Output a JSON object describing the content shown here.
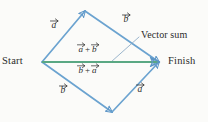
{
  "figure": {
    "kind": "vector-addition-parallelogram-diagram",
    "background_color": "#fbfbf9"
  },
  "colors": {
    "vector_blue": "#6ba3d0",
    "vector_blue_dark": "#4b86bb",
    "resultant_green": "#5aa883",
    "leader_line": "#8aa9c4",
    "text": "#2b2b2b"
  },
  "endpoints": {
    "start_label": "Start",
    "finish_label": "Finish"
  },
  "annotation": {
    "vector_sum_label": "Vector sum"
  },
  "edge_labels": {
    "top_left": {
      "letter": "a"
    },
    "top_right": {
      "letter": "b"
    },
    "bottom_left": {
      "letter": "b"
    },
    "bottom_right": {
      "letter": "a"
    }
  },
  "resultant_labels": {
    "above": {
      "first": "a",
      "operator": "+",
      "second": "b"
    },
    "below": {
      "first": "b",
      "operator": "+",
      "second": "a"
    }
  },
  "geometry": {
    "start_vertex": {
      "x": 42,
      "y": 62
    },
    "finish_vertex": {
      "x": 159,
      "y": 62
    },
    "top_vertex": {
      "x": 85,
      "y": 11
    },
    "bottom_vertex": {
      "x": 112,
      "y": 112
    },
    "leader_from": {
      "x": 139,
      "y": 37
    },
    "leader_to": {
      "x": 112,
      "y": 62
    }
  }
}
